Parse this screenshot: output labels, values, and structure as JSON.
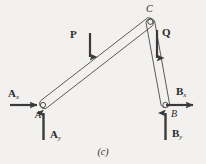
{
  "figure": {
    "caption": "(c)",
    "type": "free-body-diagram",
    "background_color": "#f2f1ef",
    "ink_color": "#3a3a3a"
  },
  "joints": [
    {
      "id": "A",
      "label": "A",
      "x": 43,
      "y": 105
    },
    {
      "id": "C",
      "label": "C",
      "x": 150,
      "y": 22
    },
    {
      "id": "B",
      "label": "B",
      "x": 165,
      "y": 105
    }
  ],
  "members": [
    {
      "id": "AC",
      "from": "A",
      "to": "C"
    },
    {
      "id": "CB",
      "from": "C",
      "to": "B"
    }
  ],
  "loads": [
    {
      "id": "P",
      "label": "P",
      "direction": "down",
      "label_x": 70,
      "label_y": 30,
      "shaft_x": 90,
      "tail_y": 33,
      "head_y": 63
    },
    {
      "id": "Q",
      "label": "Q",
      "direction": "down",
      "label_x": 162,
      "label_y": 28,
      "shaft_x": 157,
      "tail_y": 30,
      "head_y": 64
    }
  ],
  "reactions": [
    {
      "id": "Ax",
      "label": "A",
      "subscript": "x",
      "direction": "right",
      "label_x": 8,
      "label_y": 88,
      "shaft_y": 105,
      "tail_x": 10,
      "head_x": 42
    },
    {
      "id": "Ay",
      "label": "A",
      "subscript": "y",
      "direction": "up",
      "label_x": 50,
      "label_y": 129,
      "shaft_x": 43,
      "tail_y": 140,
      "head_y": 107
    },
    {
      "id": "Bx",
      "label": "B",
      "subscript": "x",
      "direction": "right",
      "label_x": 176,
      "label_y": 86,
      "shaft_y": 105,
      "tail_x": 166,
      "head_x": 199
    },
    {
      "id": "By",
      "label": "B",
      "subscript": "y",
      "direction": "up",
      "label_x": 172,
      "label_y": 128,
      "shaft_x": 165,
      "tail_y": 140,
      "head_y": 107
    }
  ],
  "joint_labels": [
    {
      "id": "A",
      "text": "A",
      "x": 36,
      "y": 111
    },
    {
      "id": "C",
      "text": "C",
      "x": 147,
      "y": 5
    },
    {
      "id": "B",
      "text": "B",
      "x": 171,
      "y": 110
    }
  ]
}
